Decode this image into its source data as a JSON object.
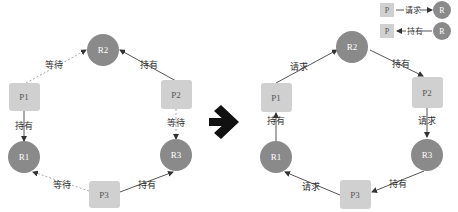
{
  "colors": {
    "process_fill": "#d0d0d0",
    "resource_fill": "#8a8a8a",
    "edge": "#444444",
    "dashed_edge": "#aaaaaa",
    "arrow": "#111111"
  },
  "left": {
    "nodes": {
      "R2": "R2",
      "P1": "P1",
      "P2": "P2",
      "R1": "R1",
      "R3": "R3",
      "P3": "P3"
    },
    "edges": {
      "p1_r2": "等待",
      "p2_r2": "持有",
      "p1_r1": "持有",
      "p2_r3": "等待",
      "p3_r1": "等待",
      "p3_r3": "持有"
    }
  },
  "right": {
    "nodes": {
      "R2": "R2",
      "P1": "P1",
      "P2": "P2",
      "R1": "R1",
      "R3": "R3",
      "P3": "P3"
    },
    "edges": {
      "p1_r2": "请求",
      "r2_p2": "持有",
      "r1_p1": "持有",
      "p2_r3": "请求",
      "p3_r1": "请求",
      "r3_p3": "持有"
    }
  },
  "legend": {
    "row1": {
      "process": "P",
      "label": "请求",
      "resource": "R"
    },
    "row2": {
      "process": "P",
      "label": "持有",
      "resource": "R"
    }
  }
}
